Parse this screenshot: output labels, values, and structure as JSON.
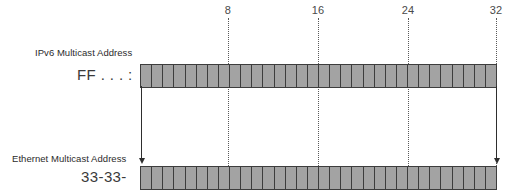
{
  "figure": {
    "bit_count": 32,
    "colors": {
      "cell_fill": "#a3a3a3",
      "cell_border": "#3d3d3d",
      "guide_line": "#5a5a5a",
      "arrow": "#2e2e2e",
      "tick_text": "#4a4a4a",
      "caption_text": "#2b2b2b",
      "background": "#ffffff"
    },
    "ticks": [
      {
        "label": "8",
        "x": 228
      },
      {
        "label": "16",
        "x": 318
      },
      {
        "label": "24",
        "x": 408
      },
      {
        "label": "32",
        "x": 496
      }
    ],
    "rows": [
      {
        "caption": "IPv6 Multicast Address",
        "prefix": "FF . . . :",
        "cells": 32
      },
      {
        "caption": "Ethernet Multicast Address",
        "prefix": "33-33-",
        "cells": 32
      }
    ],
    "connectors": [
      {
        "name": "left-mapping-arrow",
        "x": 141
      },
      {
        "name": "right-mapping-arrow",
        "x": 496
      }
    ]
  }
}
